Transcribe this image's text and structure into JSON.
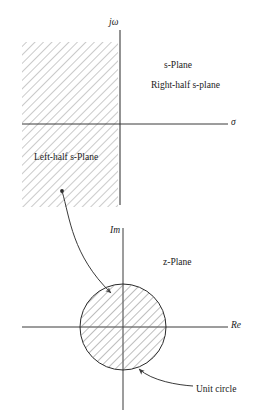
{
  "figure": {
    "stroke_color": "#3a3a3a",
    "hatch_color": "#7a7a7a",
    "background": "#ffffff"
  },
  "s_plane": {
    "plane_label": "s-Plane",
    "right_half_label": "Right-half s-plane",
    "left_half_label": "Left-half s-Plane",
    "vertical_axis_label": "jω",
    "horizontal_axis_label": "σ",
    "shaded_region": "left-half-plane",
    "axis": {
      "vertical_x": 120,
      "vertical_y_top": 30,
      "vertical_y_bottom": 205,
      "horizontal_y": 124,
      "horizontal_x_left": 22,
      "horizontal_x_right": 228
    },
    "hatched_rect": {
      "x": 22,
      "y": 42,
      "width": 96,
      "height": 165
    }
  },
  "z_plane": {
    "plane_label": "z-Plane",
    "vertical_axis_label": "Im",
    "horizontal_axis_label": "Re",
    "unit_circle_label": "Unit circle",
    "shaded_region": "interior-of-unit-circle",
    "axis": {
      "vertical_x": 123,
      "vertical_y_top": 228,
      "vertical_y_bottom": 410,
      "horizontal_y": 327,
      "horizontal_x_left": 22,
      "horizontal_x_right": 228
    },
    "circle": {
      "cx": 123,
      "cy": 327,
      "r": 43
    }
  },
  "annotations": {
    "mapping_arrow": {
      "name": "left-half-plane-to-unit-circle-arrow",
      "from_point": [
        62,
        191
      ],
      "to_point": [
        113,
        295
      ]
    },
    "unit_circle_arrow": {
      "name": "unit-circle-callout-arrow",
      "from_point": [
        193,
        386
      ],
      "to_point": [
        137,
        367
      ]
    }
  }
}
